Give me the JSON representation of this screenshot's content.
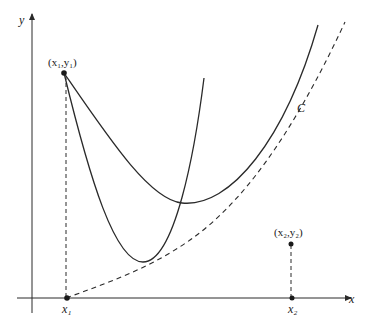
{
  "diagram": {
    "axes": {
      "x_label": "x",
      "y_label": "y"
    },
    "points": {
      "p1": {
        "label": "(x₁,y₁)"
      },
      "p2": {
        "label": "(x₂,y₂)"
      }
    },
    "x_ticks": {
      "x1": "x₁",
      "x2": "x₂"
    },
    "curve_label": "C",
    "colors": {
      "ink": "#2a2a2a",
      "background": "#ffffff"
    }
  }
}
